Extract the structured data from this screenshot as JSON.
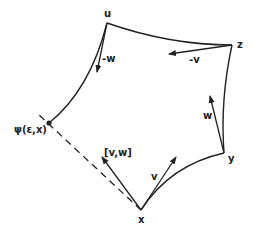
{
  "diagram": {
    "type": "geodesic-quadrilateral",
    "vertices": {
      "u": {
        "label": "u"
      },
      "z": {
        "label": "z"
      },
      "y": {
        "label": "y"
      },
      "x": {
        "label": "x"
      },
      "psi": {
        "label": "ψ(ε,x)"
      }
    },
    "vectors": {
      "neg_w": {
        "label": "-w"
      },
      "neg_v": {
        "label": "-v"
      },
      "w": {
        "label": "w"
      },
      "v": {
        "label": "v"
      },
      "bracket": {
        "label": "[v,w]"
      }
    },
    "colors": {
      "ink": "#222222",
      "background": "#ffffff"
    }
  }
}
